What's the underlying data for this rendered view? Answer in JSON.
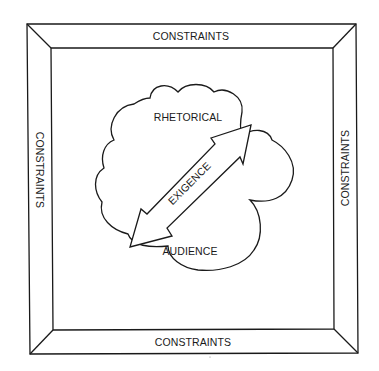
{
  "diagram": {
    "type": "rhetorical-situation-model",
    "frame": {
      "top_label": "CONSTRAINTS",
      "bottom_label": "CONSTRAINTS",
      "left_label": "CONSTRAINTS",
      "right_label": "CONSTRAINTS"
    },
    "cloud": {
      "upper_label": "RHETORICAL",
      "lower_label": "AUDIENCE"
    },
    "arrow": {
      "label": "EXIGENCE",
      "direction": "bidirectional"
    },
    "colors": {
      "stroke": "#1a1a1a",
      "background": "#ffffff"
    }
  }
}
